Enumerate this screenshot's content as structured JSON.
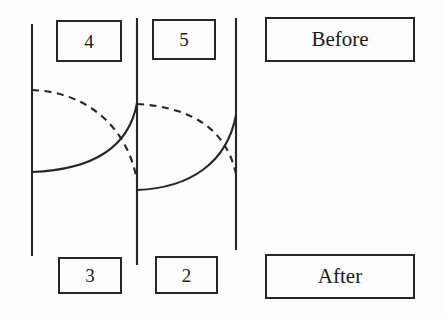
{
  "figure": {
    "type": "technical-line-diagram",
    "background_color": "#fdfdfd",
    "line_color": "#272727"
  },
  "labels": {
    "top_left_number": "4",
    "top_right_number": "5",
    "top_state": "Before",
    "bottom_left_number": "3",
    "bottom_right_number": "2",
    "bottom_state": "After"
  },
  "geometry": {
    "vertical_lines": [
      {
        "name": "left-boundary",
        "x": 32,
        "y1": 24,
        "y2": 256
      },
      {
        "name": "middle-boundary",
        "x": 137,
        "y1": 18,
        "y2": 265
      },
      {
        "name": "right-boundary",
        "x": 236,
        "y1": 18,
        "y2": 250
      }
    ],
    "cell_one": {
      "dashed_arc": {
        "from_x": 32,
        "from_y": 90,
        "to_x": 137,
        "to_y": 181
      },
      "solid_arc": {
        "from_x": 32,
        "from_y": 172,
        "to_x": 137,
        "to_y": 103
      }
    },
    "cell_two": {
      "dashed_arc": {
        "from_x": 137,
        "from_y": 104,
        "to_x": 236,
        "to_y": 174
      },
      "solid_arc": {
        "from_x": 137,
        "from_y": 190,
        "to_x": 236,
        "to_y": 115
      }
    },
    "boxes": [
      {
        "name": "box-4",
        "x": 56,
        "y": 20,
        "w": 66,
        "h": 42
      },
      {
        "name": "box-5",
        "x": 152,
        "y": 19,
        "w": 64,
        "h": 41
      },
      {
        "name": "box-before",
        "x": 265,
        "y": 17,
        "w": 150,
        "h": 45
      },
      {
        "name": "box-3",
        "x": 58,
        "y": 257,
        "w": 64,
        "h": 37
      },
      {
        "name": "box-2",
        "x": 155,
        "y": 256,
        "w": 63,
        "h": 38
      },
      {
        "name": "box-after",
        "x": 265,
        "y": 254,
        "w": 150,
        "h": 45
      }
    ]
  }
}
